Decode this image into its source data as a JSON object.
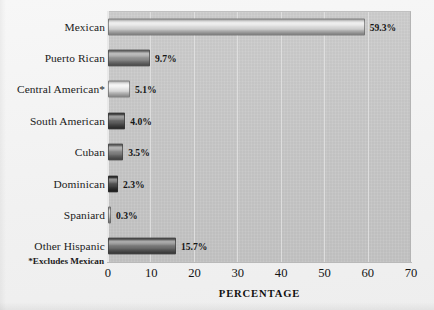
{
  "chart_data": {
    "type": "bar",
    "orientation": "horizontal",
    "title": "",
    "xlabel": "PERCENTAGE",
    "ylabel": "",
    "xlim": [
      0,
      70
    ],
    "xticks": [
      0,
      10,
      20,
      30,
      40,
      50,
      60,
      70
    ],
    "grid": true,
    "legend": null,
    "footnote": "*Excludes Mexican",
    "categories": [
      "Mexican",
      "Puerto Rican",
      "Central American*",
      "South American",
      "Cuban",
      "Dominican",
      "Spaniard",
      "Other Hispanic"
    ],
    "values": [
      59.3,
      9.7,
      5.1,
      4.0,
      3.5,
      2.3,
      0.3,
      15.7
    ],
    "value_labels": [
      "59.3%",
      "9.7%",
      "5.1%",
      "4.0%",
      "3.5%",
      "2.3%",
      "0.3%",
      "15.7%"
    ],
    "bar_colors": [
      "#d2d2d2",
      "#8a8a8a",
      "#dcdcdc",
      "#5d5d5d",
      "#7d7d7d",
      "#4a4a4a",
      "#bdbdbd",
      "#707070"
    ],
    "plot_background": "#c8c8c8",
    "page_background": "#f2f2f2",
    "gridline_color": "#e2e2e2"
  }
}
